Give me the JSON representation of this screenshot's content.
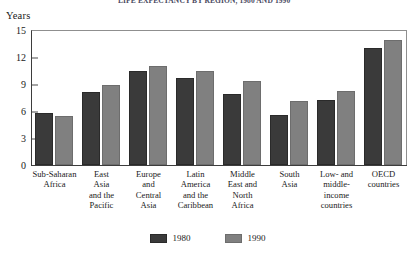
{
  "figure": {
    "title_clipped": "LIFE EXPECTANCY BY REGION, 1980 AND 1990",
    "y_axis_name": "Years"
  },
  "chart_data": {
    "type": "bar",
    "title": "LIFE EXPECTANCY BY REGION, 1980 AND 1990",
    "xlabel": "",
    "ylabel": "Years",
    "ylim": [
      0,
      15
    ],
    "yticks": [
      0,
      3,
      6,
      9,
      12,
      15
    ],
    "grid": false,
    "legend_position": "bottom-center",
    "categories": [
      "Sub-Saharan Africa",
      "East Asia and the Pacific",
      "Europe and Central Asia",
      "Latin America and the Caribbean",
      "Middle East and North Africa",
      "South Asia",
      "Low- and middle-income countries",
      "OECD countries"
    ],
    "category_lines": [
      [
        "Sub-Saharan",
        "Africa"
      ],
      [
        "East",
        "Asia",
        "and the",
        "Pacific"
      ],
      [
        "Europe",
        "and",
        "Central",
        "Asia"
      ],
      [
        "Latin",
        "America",
        "and the",
        "Caribbean"
      ],
      [
        "Middle",
        "East and",
        "North",
        "Africa"
      ],
      [
        "South",
        "Asia"
      ],
      [
        "Low- and",
        "middle-",
        "income",
        "countries"
      ],
      [
        "OECD",
        "countries"
      ]
    ],
    "series": [
      {
        "name": "1980",
        "color": "#3a3a3a",
        "values": [
          5.8,
          8.1,
          10.4,
          9.7,
          7.9,
          5.6,
          7.2,
          13.0
        ]
      },
      {
        "name": "1990",
        "color": "#808080",
        "values": [
          5.5,
          8.9,
          11.0,
          10.5,
          9.3,
          7.1,
          8.2,
          13.9
        ]
      }
    ]
  },
  "legend": {
    "items": [
      {
        "label": "1980",
        "color": "#3a3a3a"
      },
      {
        "label": "1990",
        "color": "#808080"
      }
    ]
  }
}
